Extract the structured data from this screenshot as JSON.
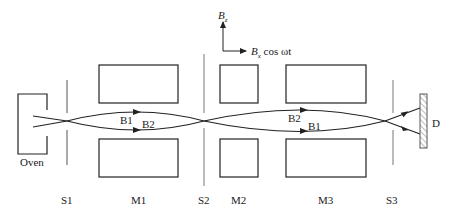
{
  "diagram": {
    "axes": {
      "vertical_label": "B",
      "vertical_sub": "z",
      "horizontal_label": "B",
      "horizontal_sub": "x",
      "horizontal_suffix": " cos ωt"
    },
    "components": {
      "oven": "Oven",
      "slit1": "S1",
      "magnet1": "M1",
      "slit2": "S2",
      "magnet2": "M2",
      "magnet3": "M3",
      "slit3": "S3",
      "detector": "D"
    },
    "beams": {
      "m1_upper": "B1",
      "m1_lower": "B2",
      "m3_upper": "B2",
      "m3_lower": "B1"
    },
    "colors": {
      "line": "#222222",
      "slit": "#555555",
      "hatch": "#777777"
    }
  }
}
